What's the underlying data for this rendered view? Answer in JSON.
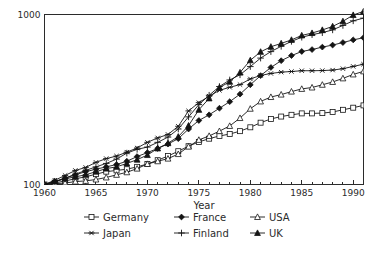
{
  "chart_data": {
    "type": "line",
    "title": "",
    "subtitle": "",
    "xlabel": "Year",
    "ylabel": "",
    "yscale": "log",
    "ylim": [
      100,
      1000
    ],
    "xlim": [
      1960,
      1991
    ],
    "grid": false,
    "legend_position": "bottom",
    "y_tick_labels": [
      "100",
      "1000"
    ],
    "y_ticks": [
      100,
      1000
    ],
    "x_ticks": [
      1960,
      1965,
      1970,
      1975,
      1980,
      1985,
      1990
    ],
    "x_tick_labels": [
      "1960",
      "1965",
      "1970",
      "1975",
      "1980",
      "1985",
      "1990"
    ],
    "x_minor_tick_step": 1,
    "x": [
      1960,
      1961,
      1962,
      1963,
      1964,
      1965,
      1966,
      1967,
      1968,
      1969,
      1970,
      1971,
      1972,
      1973,
      1974,
      1975,
      1976,
      1977,
      1978,
      1979,
      1980,
      1981,
      1982,
      1983,
      1984,
      1985,
      1986,
      1987,
      1988,
      1989,
      1990,
      1991
    ],
    "series": [
      {
        "name": "Germany",
        "marker": "square-open",
        "values": [
          100,
          102,
          105,
          108,
          111,
          115,
          119,
          121,
          123,
          127,
          132,
          139,
          147,
          157,
          168,
          178,
          186,
          193,
          198,
          206,
          217,
          231,
          243,
          251,
          257,
          262,
          262,
          263,
          267,
          275,
          283,
          292
        ]
      },
      {
        "name": "France",
        "marker": "diamond-solid",
        "values": [
          100,
          104,
          109,
          114,
          119,
          123,
          127,
          131,
          137,
          146,
          154,
          163,
          173,
          186,
          212,
          238,
          257,
          281,
          307,
          340,
          386,
          437,
          488,
          535,
          573,
          606,
          622,
          643,
          661,
          684,
          709,
          730
        ]
      },
      {
        "name": "USA",
        "marker": "triangle-open",
        "values": [
          100,
          101,
          102,
          104,
          105,
          107,
          110,
          114,
          118,
          124,
          132,
          137,
          142,
          151,
          167,
          183,
          193,
          206,
          221,
          246,
          279,
          308,
          327,
          338,
          352,
          365,
          372,
          386,
          401,
          421,
          444,
          463
        ]
      },
      {
        "name": "Japan",
        "marker": "asterisk",
        "values": [
          100,
          106,
          113,
          121,
          126,
          135,
          142,
          147,
          155,
          164,
          177,
          188,
          197,
          220,
          271,
          303,
          331,
          358,
          373,
          387,
          418,
          438,
          450,
          458,
          462,
          467,
          467,
          468,
          471,
          480,
          495,
          510
        ]
      },
      {
        "name": "Finland",
        "marker": "plus",
        "values": [
          100,
          104,
          109,
          115,
          121,
          127,
          133,
          141,
          153,
          161,
          166,
          177,
          190,
          212,
          250,
          295,
          335,
          377,
          412,
          442,
          494,
          554,
          605,
          650,
          695,
          735,
          761,
          782,
          812,
          862,
          918,
          952
        ]
      },
      {
        "name": "UK",
        "marker": "triangle-solid",
        "values": [
          100,
          104,
          108,
          111,
          114,
          119,
          124,
          127,
          133,
          140,
          149,
          163,
          175,
          191,
          222,
          275,
          321,
          372,
          402,
          456,
          538,
          603,
          646,
          676,
          709,
          753,
          778,
          811,
          851,
          912,
          993,
          1043
        ]
      }
    ]
  },
  "legend": {
    "entries": [
      {
        "label": "Germany",
        "marker": "square-open"
      },
      {
        "label": "France",
        "marker": "diamond-solid"
      },
      {
        "label": "USA",
        "marker": "triangle-open"
      },
      {
        "label": "Japan",
        "marker": "asterisk"
      },
      {
        "label": "Finland",
        "marker": "plus"
      },
      {
        "label": "UK",
        "marker": "triangle-solid"
      }
    ]
  },
  "colors": {
    "ink": "#141414",
    "axis": "#2b2b2b",
    "background": "#ffffff"
  }
}
